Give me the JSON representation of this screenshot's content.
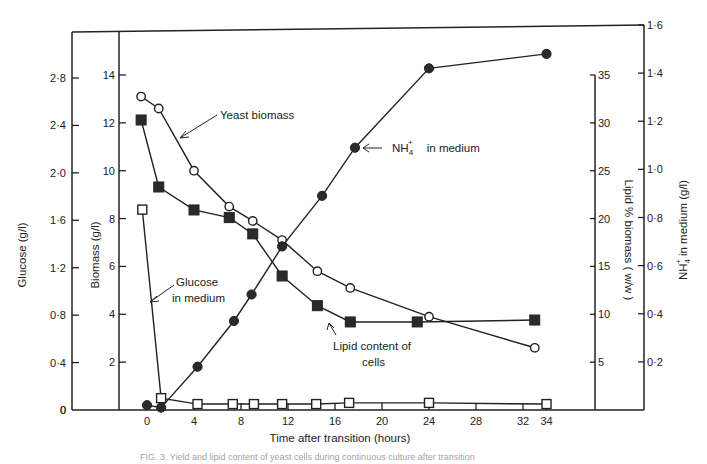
{
  "chart_data": {
    "type": "line",
    "title": "",
    "xlabel": "Time after transition (hours)",
    "x_ticks": [
      0,
      4,
      8,
      12,
      16,
      20,
      24,
      28,
      32,
      34
    ],
    "xlim": [
      -1.5,
      35.5
    ],
    "axes": {
      "glucose": {
        "label": "Glucose (g/l)",
        "ticks": [
          "0",
          "0·4",
          "0·8",
          "1·2",
          "1·6",
          "2·0",
          "2·4",
          "2·8"
        ],
        "range": [
          0,
          3.2
        ]
      },
      "biomass": {
        "label": "Biomass (g/l)",
        "ticks": [
          "2",
          "4",
          "6",
          "8",
          "10",
          "12",
          "14"
        ],
        "range": [
          0,
          16
        ]
      },
      "lipid": {
        "label": "Lipid % biomass (w/w)",
        "ticks": [
          "5",
          "10",
          "15",
          "20",
          "25",
          "30",
          "35"
        ],
        "range": [
          0,
          35
        ]
      },
      "nh4": {
        "label": "NH4+ in medium (g/l)",
        "ticks": [
          "0·2",
          "0·4",
          "0·6",
          "0·8",
          "1·0",
          "1·2",
          "1·4",
          "1·6"
        ],
        "range": [
          0,
          1.6
        ]
      }
    },
    "series": [
      {
        "name": "Yeast biomass",
        "axis": "biomass",
        "marker": "open-circle",
        "x": [
          -0.5,
          1,
          4,
          7,
          9,
          11.5,
          14.5,
          17.3,
          24,
          33
        ],
        "y": [
          13.1,
          12.6,
          10.0,
          8.5,
          7.9,
          7.1,
          5.8,
          5.1,
          3.9,
          2.6
        ]
      },
      {
        "name": "Lipid content of cells",
        "axis": "lipid",
        "marker": "filled-square",
        "x": [
          -0.5,
          1,
          4,
          7,
          9,
          11.5,
          14.5,
          17.3,
          23,
          33
        ],
        "y": [
          30.3,
          23.3,
          20.9,
          20.1,
          18.4,
          14.0,
          10.9,
          9.2,
          9.2,
          9.4
        ]
      },
      {
        "name": "NH4+ in medium",
        "axis": "nh4",
        "marker": "filled-circle",
        "x": [
          0,
          1.2,
          4.3,
          7.4,
          8.9,
          11.5,
          14.9,
          17.7,
          24,
          34
        ],
        "y": [
          0.02,
          0.01,
          0.18,
          0.37,
          0.48,
          0.68,
          0.89,
          1.09,
          1.42,
          1.48
        ]
      },
      {
        "name": "Glucose in medium",
        "axis": "glucose",
        "marker": "open-square",
        "x": [
          -0.4,
          1.2,
          4.3,
          7.3,
          9.1,
          11.5,
          14.4,
          17.2,
          24,
          34
        ],
        "y": [
          1.69,
          0.1,
          0.05,
          0.05,
          0.05,
          0.05,
          0.05,
          0.06,
          0.06,
          0.05
        ]
      }
    ],
    "annotations": [
      {
        "text": "Yeast  biomass",
        "target": "Yeast biomass"
      },
      {
        "text": "NH4+  in medium",
        "target": "NH4+ in medium"
      },
      {
        "text": "Glucose in medium",
        "target": "Glucose in medium"
      },
      {
        "text": "Lipid content of cells",
        "target": "Lipid content of cells"
      }
    ],
    "grid": false,
    "legend": "none (inline annotations with arrows)"
  },
  "labels": {
    "xlabel": "Time after transition (hours)",
    "glucose_axis": "Glucose (g/l)",
    "biomass_axis": "Biomass (g/l)",
    "lipid_axis": "Lipid  %  biomass  ( w/w )",
    "nh4_axis_main": "NH",
    "nh4_axis_sub": "4",
    "nh4_axis_sup": "+",
    "nh4_axis_rest": " in medium (g/l)",
    "annot_yeast": "Yeast   biomass",
    "annot_nh4_main": "NH",
    "annot_nh4_sub": "4",
    "annot_nh4_sup": "+",
    "annot_nh4_rest": "in medium",
    "annot_glucose_1": "Glucose",
    "annot_glucose_2": "in medium",
    "annot_lipid_1": "Lipid content  of",
    "annot_lipid_2": "cells"
  },
  "caption": "FIG. 3. Yield and lipid content of yeast cells during continuous culture after transition"
}
